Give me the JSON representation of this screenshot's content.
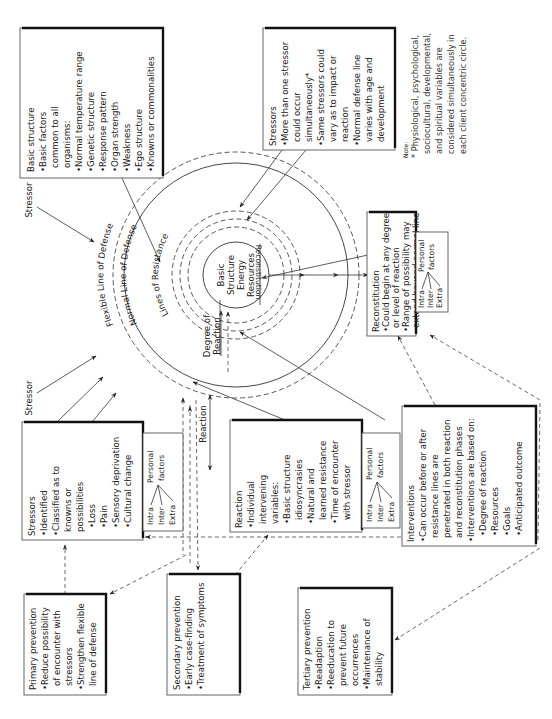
{
  "diagram": {
    "orientation": "rotated 90 degrees counter-clockwise",
    "core": {
      "lines": [
        "Basic",
        "Structure",
        "Energy",
        "Resources"
      ]
    },
    "circle_labels": {
      "flexible": "Flexible Line of Defense",
      "normal": "Normal Line of Defense",
      "resistance": "Lines of Resistance",
      "degree_of_reaction": [
        "Degree of",
        "Reaction"
      ],
      "reconstitution": "Reconstitution"
    },
    "arrow_labels": {
      "stressor_top": "Stressor",
      "stressor_bottom": "Stressor",
      "reaction": "Reaction"
    },
    "boxes": {
      "basic_structure": {
        "title": "Basic structure",
        "lines": [
          "•Basic factors",
          "   common to all",
          "   organisms:",
          "•Normal temperature range",
          "•Genetic structure",
          "•Response pattern",
          "•Organ strength",
          "•Weakness",
          "•Ego structure",
          "•Knowns or commonalities"
        ]
      },
      "stressors_top": {
        "title": "Stressors",
        "lines": [
          "•More than one stressor",
          "   could occur",
          "   simultaneously*",
          "•Same stressors could",
          "   vary as to impact or",
          "   reaction",
          "•Normal defense line",
          "   varies with age and",
          "   development"
        ]
      },
      "note": {
        "heading": "Note:",
        "lines": [
          "* Physiological, psychological,",
          "   sociocultural, developmental,",
          "   and spiritual variables are",
          "   considered simultaneously in",
          "   each client concentric circle."
        ]
      },
      "reconstitution": {
        "title": "Reconstitution",
        "lines": [
          "•Could begin at any degree",
          "   or level of reaction",
          "•Range of possibility may",
          "   extend beyond normal line",
          "   of defense"
        ]
      },
      "stressors_left": {
        "title": "Stressors",
        "lines": [
          "•Identified",
          "•Classified as to",
          "   knowns or",
          "   possibilities",
          "   •Loss",
          "   •Pain",
          "   •Sensory deprivation",
          "   •Cultural change"
        ]
      },
      "reaction": {
        "title": "Reaction",
        "lines": [
          "•Individual",
          "   intervening",
          "   variables:",
          "   •Basic structure",
          "      idiosyncrasies",
          "   •Natural and",
          "      learned resistance",
          "   •Time of encounter",
          "      with stressor"
        ]
      },
      "interventions": {
        "title": "Interventions",
        "lines": [
          "•Can occur before or after",
          "   resistance lines are",
          "   penetrated in both reaction",
          "   and reconstitution phases",
          "•Interventions are based on:",
          "   •Degree of reaction",
          "   •Resources",
          "   •Goals",
          "   •Anticipated outcome"
        ]
      },
      "primary_prevention": {
        "title": "Primary prevention",
        "lines": [
          "•Reduce possibility",
          "   of encounter with",
          "   stressors",
          "•Strengthen flexible",
          "   line of defense"
        ]
      },
      "secondary_prevention": {
        "title": "Secondary prevention",
        "lines": [
          "•Early case-finding",
          "•Treatment of symptoms"
        ]
      },
      "tertiary_prevention": {
        "title": "Tertiary prevention",
        "lines": [
          "•Readaption",
          "•Reeducation to",
          "   prevent future",
          "   occurrences",
          "•Maintenance of",
          "   stability"
        ]
      }
    },
    "personal_factors": {
      "intra": "Intra",
      "inter": "Inter",
      "extra": "Extra",
      "personal": "Personal",
      "factors": "factors"
    }
  }
}
